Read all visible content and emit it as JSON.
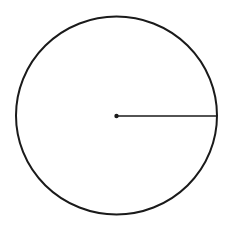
{
  "diagram": {
    "type": "circle-with-radius",
    "background": "#ffffff",
    "stroke_color": "#1a1a1a",
    "circle": {
      "cx": 116.5,
      "cy": 115.5,
      "r": 100.5,
      "stroke_width": 2
    },
    "center_point": {
      "cx": 116.5,
      "cy": 116,
      "r": 2.2
    },
    "radius_line": {
      "x1": 116.5,
      "y1": 116,
      "x2": 217,
      "y2": 116,
      "stroke_width": 1.6
    }
  }
}
